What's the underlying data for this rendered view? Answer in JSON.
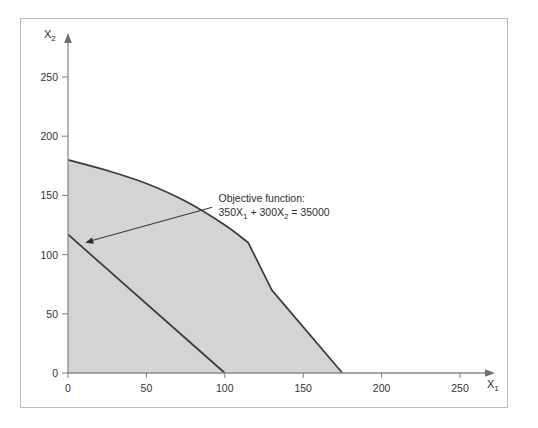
{
  "chart_data": {
    "type": "area",
    "title": "",
    "xlabel": "X1",
    "ylabel": "X2",
    "xlabel_display": "X",
    "xlabel_sub": "1",
    "ylabel_display": "X",
    "ylabel_sub": "2",
    "xlim": [
      0,
      270
    ],
    "ylim": [
      0,
      268
    ],
    "grid": false,
    "legend": "none",
    "xticks": [
      0,
      50,
      100,
      150,
      200,
      250
    ],
    "yticks": [
      0,
      50,
      100,
      150,
      200,
      250
    ],
    "xtick_labels": [
      "0",
      "50",
      "100",
      "150",
      "200",
      "250"
    ],
    "ytick_labels": [
      "0",
      "50",
      "100",
      "150",
      "200",
      "250"
    ],
    "series": [
      {
        "name": "feasible-region-boundary",
        "kind": "area",
        "fill": "#d4d4d4",
        "stroke": "#3a3a3a",
        "points": [
          [
            0,
            180
          ],
          [
            25,
            171
          ],
          [
            50,
            160
          ],
          [
            75,
            145
          ],
          [
            100,
            125
          ],
          [
            115,
            110
          ],
          [
            130,
            70
          ],
          [
            175,
            0
          ]
        ]
      },
      {
        "name": "objective-function-line",
        "kind": "line",
        "stroke": "#3a3a3a",
        "points": [
          [
            0,
            117
          ],
          [
            100,
            0
          ]
        ]
      }
    ],
    "annotations": [
      {
        "name": "objective-function-annotation",
        "line1": "Objective function:",
        "line2_a": "350X",
        "line2_sub_a": "1",
        "line2_b": " + 300X",
        "line2_sub_b": "2",
        "line2_c": " = 35000",
        "text_x": 96,
        "text_y": 148,
        "leader_from": [
          92,
          140
        ],
        "leader_to": [
          11,
          110
        ]
      }
    ],
    "colors": {
      "region_fill": "#d4d4d4",
      "line": "#3a3a3a",
      "axis": "#7a7a7a",
      "frame_border": "#b9b9b9",
      "text": "#2e2e2e",
      "background": "#ffffff"
    }
  }
}
